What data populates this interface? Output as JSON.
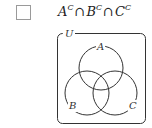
{
  "question": {
    "checkbox_checked": false,
    "expression": {
      "terms": [
        {
          "set": "A",
          "sup": "C"
        },
        {
          "set": "B",
          "sup": "C"
        },
        {
          "set": "C",
          "sup": "C"
        }
      ],
      "operator": "∩"
    }
  },
  "venn": {
    "universe_label": "U",
    "sets": [
      {
        "label": "A",
        "cx": 101,
        "cy": 68,
        "r": 22
      },
      {
        "label": "B",
        "cx": 87,
        "cy": 93,
        "r": 22
      },
      {
        "label": "C",
        "cx": 115,
        "cy": 93,
        "r": 22
      }
    ],
    "shaded": false,
    "line_color": "#333333"
  }
}
